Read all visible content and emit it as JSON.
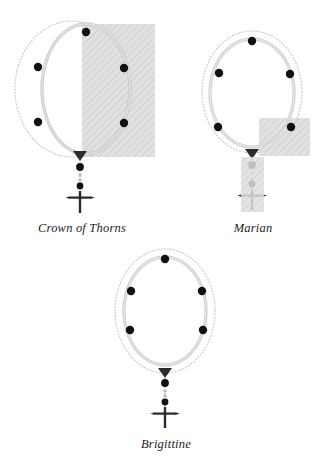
{
  "page": {
    "background_color": "#ffffff",
    "width": 323,
    "height": 466
  },
  "style": {
    "bead_color": "#111111",
    "chain_color": "#b9b9b9",
    "outer_ring_color": "#c9c9c9",
    "highlight_fill": "#d6d6d6",
    "highlight_hatch_color": "#bdbdbd",
    "caption_color": "#1d1d1d"
  },
  "figures": [
    {
      "id": "crown-of-thorns",
      "caption": "Crown of Thorns",
      "loop": {
        "outer_ring": {
          "cx": 72,
          "cy": 89,
          "rx": 57,
          "ry": 68
        },
        "bead_chain": {
          "cx": 86,
          "cy": 89,
          "rx": 44,
          "ry": 65
        }
      },
      "marker_beads": [
        {
          "x": 86,
          "y": 32
        },
        {
          "x": 38,
          "y": 67
        },
        {
          "x": 124,
          "y": 68
        },
        {
          "x": 38,
          "y": 122
        },
        {
          "x": 124,
          "y": 123
        }
      ],
      "connector": {
        "x": 80,
        "y": 155,
        "shape": "triangle-down"
      },
      "pendant": {
        "beads": [
          {
            "x": 80,
            "y": 166,
            "size": "large"
          },
          {
            "x": 80,
            "y": 174,
            "size": "small"
          },
          {
            "x": 80,
            "y": 180,
            "size": "small"
          },
          {
            "x": 80,
            "y": 186,
            "size": "medium"
          }
        ],
        "cross": {
          "x": 80,
          "y": 193
        }
      },
      "highlight": {
        "x": 82,
        "y": 24,
        "width": 73,
        "height": 133,
        "label": "highlight-rectangle"
      }
    },
    {
      "id": "marian",
      "caption": "Marian",
      "loop": {
        "outer_ring": {
          "cx": 252,
          "cy": 92,
          "rx": 50,
          "ry": 61
        },
        "bead_chain": {
          "cx": 252,
          "cy": 93,
          "rx": 42,
          "ry": 54
        }
      },
      "marker_beads": [
        {
          "x": 252,
          "y": 41
        },
        {
          "x": 219,
          "y": 73
        },
        {
          "x": 290,
          "y": 74
        },
        {
          "x": 218,
          "y": 127
        },
        {
          "x": 291,
          "y": 127
        }
      ],
      "connector": {
        "x": 252,
        "y": 153,
        "shape": "triangle-down"
      },
      "pendant": {
        "beads": [
          {
            "x": 252,
            "y": 164,
            "size": "large"
          },
          {
            "x": 252,
            "y": 172,
            "size": "small"
          },
          {
            "x": 252,
            "y": 178,
            "size": "small"
          },
          {
            "x": 252,
            "y": 184,
            "size": "medium"
          }
        ],
        "cross": {
          "x": 252,
          "y": 191
        }
      },
      "highlight": {
        "x": 259,
        "y": 118,
        "width": 51,
        "height": 38,
        "label": "highlight-rectangle-loop"
      },
      "highlight_2": {
        "x": 241,
        "y": 155,
        "width": 23,
        "height": 55,
        "label": "highlight-rectangle-pendant"
      }
    },
    {
      "id": "brigittine",
      "caption": "Brigittine",
      "loop": {
        "outer_ring": {
          "cx": 165,
          "cy": 311,
          "rx": 50,
          "ry": 62
        },
        "bead_chain": {
          "cx": 165,
          "cy": 311,
          "rx": 41,
          "ry": 54
        }
      },
      "marker_beads": [
        {
          "x": 165,
          "y": 259
        },
        {
          "x": 131,
          "y": 291
        },
        {
          "x": 202,
          "y": 291
        },
        {
          "x": 130,
          "y": 330
        },
        {
          "x": 203,
          "y": 330
        }
      ],
      "connector": {
        "x": 165,
        "y": 372,
        "shape": "triangle-down"
      },
      "pendant": {
        "beads": [
          {
            "x": 165,
            "y": 382,
            "size": "large"
          },
          {
            "x": 165,
            "y": 390,
            "size": "small"
          },
          {
            "x": 165,
            "y": 396,
            "size": "small"
          },
          {
            "x": 165,
            "y": 402,
            "size": "medium"
          }
        ],
        "cross": {
          "x": 165,
          "y": 409
        }
      },
      "highlight": null
    }
  ],
  "captions": {
    "crown_of_thorns": {
      "text": "Crown of Thorns",
      "x": 20,
      "y": 221,
      "width": 124
    },
    "marian": {
      "text": "Marian",
      "x": 222,
      "y": 221,
      "width": 62
    },
    "brigittine": {
      "text": "Brigittine",
      "x": 131,
      "y": 437,
      "width": 70
    }
  }
}
